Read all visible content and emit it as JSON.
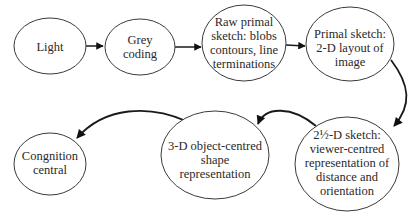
{
  "diagram": {
    "type": "flowchart",
    "nodes": [
      {
        "id": "light",
        "lines": [
          "Light"
        ]
      },
      {
        "id": "grey",
        "lines": [
          "Grey",
          "coding"
        ]
      },
      {
        "id": "raw",
        "lines": [
          "Raw primal",
          "sketch: blobs",
          "contours, line",
          "terminations"
        ]
      },
      {
        "id": "primal",
        "lines": [
          "Primal  sketch:",
          "2-D layout of",
          "image"
        ]
      },
      {
        "id": "twohalf",
        "lines": [
          "2½-D sketch:",
          "viewer-centred",
          "representation of",
          "distance and",
          "orientation"
        ]
      },
      {
        "id": "threed",
        "lines": [
          "3-D object-centred",
          "shape",
          "representation"
        ]
      },
      {
        "id": "cognition",
        "lines": [
          "Congnition",
          "central"
        ]
      }
    ],
    "edges": [
      {
        "from": "light",
        "to": "grey"
      },
      {
        "from": "grey",
        "to": "raw"
      },
      {
        "from": "raw",
        "to": "primal"
      },
      {
        "from": "primal",
        "to": "twohalf"
      },
      {
        "from": "twohalf",
        "to": "threed"
      },
      {
        "from": "threed",
        "to": "cognition"
      }
    ]
  }
}
